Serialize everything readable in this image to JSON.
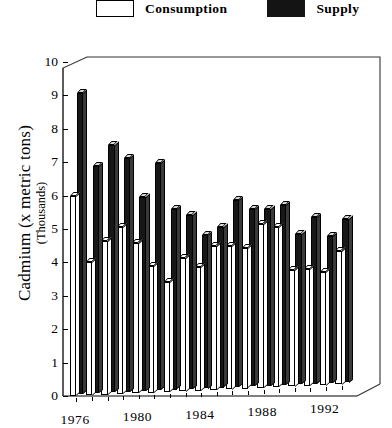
{
  "legend": {
    "items": [
      {
        "label": "Consumption",
        "swatch": "open-white",
        "color": "#ffffff"
      },
      {
        "label": "Supply",
        "swatch": "solid-black",
        "color": "#141414"
      }
    ]
  },
  "axes": {
    "y_title_line1": "Cadmium (x metric tons)",
    "y_title_line2": "(Thousands)",
    "y_ticks": [
      "0",
      "1",
      "2",
      "3",
      "4",
      "5",
      "6",
      "7",
      "8",
      "9",
      "10"
    ],
    "x_ticks": [
      "1976",
      "1980",
      "1984",
      "1988",
      "1992"
    ]
  },
  "chart_data": {
    "type": "bar",
    "title": "",
    "xlabel": "",
    "ylabel": "Cadmium (x metric tons) (Thousands)",
    "ylim": [
      0,
      10
    ],
    "grid": false,
    "legend_position": "top",
    "categories": [
      "1976",
      "1977",
      "1978",
      "1979",
      "1980",
      "1981",
      "1982",
      "1983",
      "1984",
      "1985",
      "1986",
      "1987",
      "1988",
      "1989",
      "1990",
      "1991",
      "1992",
      "1993"
    ],
    "series": [
      {
        "name": "Consumption",
        "color": "#ffffff",
        "values": [
          6.0,
          4.0,
          4.6,
          5.0,
          4.5,
          3.8,
          3.3,
          4.0,
          3.7,
          4.3,
          4.3,
          4.2,
          4.9,
          4.8,
          3.5,
          3.5,
          3.4,
          4.0
        ]
      },
      {
        "name": "Supply",
        "color": "#141414",
        "values": [
          9.0,
          6.8,
          7.4,
          7.0,
          5.8,
          6.8,
          5.4,
          5.2,
          4.6,
          4.8,
          5.6,
          5.3,
          5.3,
          5.4,
          4.5,
          5.0,
          4.4,
          4.9
        ]
      }
    ],
    "x_tick_labels_shown": [
      "1976",
      "1980",
      "1984",
      "1988",
      "1992"
    ]
  }
}
